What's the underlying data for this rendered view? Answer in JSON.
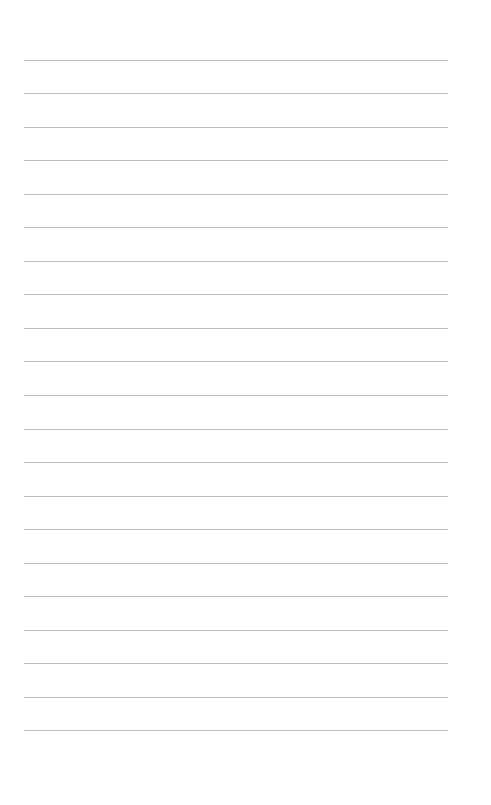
{
  "page": {
    "type": "lined-paper",
    "background_color": "#ffffff",
    "line_color": "#bdbdbd",
    "line_count": 21,
    "line_left": 24,
    "line_width": 424,
    "line_positions": [
      60,
      93,
      127,
      160,
      194,
      227,
      261,
      294,
      328,
      361,
      395,
      429,
      462,
      496,
      529,
      563,
      596,
      630,
      663,
      697,
      730
    ],
    "text": ""
  }
}
